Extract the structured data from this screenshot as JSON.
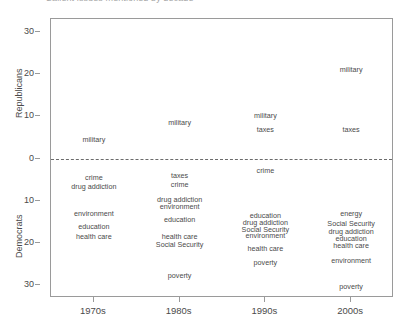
{
  "chart_data": {
    "type": "scatter",
    "title": "Salient issues mentioned by decade",
    "xlabel": "",
    "ylabel_upper": "Republicans",
    "ylabel_lower": "Democrats",
    "x_categories": [
      "1970s",
      "1980s",
      "1990s",
      "2000s"
    ],
    "y_ticks_upper": [
      30,
      20,
      10,
      0
    ],
    "y_ticks_lower": [
      10,
      20,
      30
    ],
    "y_tick_labels": [
      "30",
      "20",
      "10",
      "0",
      "10",
      "20",
      "30"
    ],
    "ylim": [
      -33,
      33
    ],
    "grid": false,
    "legend": null,
    "zero_line": "dashed",
    "note": "Upper half = Republicans (positive), lower half = Democrats (plotted downward). Labels are text markers positioned at their value.",
    "series": [
      {
        "name": "Republicans",
        "points": [
          {
            "decade": "1970s",
            "label": "military",
            "value": 4.3
          },
          {
            "decade": "1980s",
            "label": "military",
            "value": 8.5
          },
          {
            "decade": "1990s",
            "label": "military",
            "value": 10.2
          },
          {
            "decade": "1990s",
            "label": "taxes",
            "value": 6.8
          },
          {
            "decade": "2000s",
            "label": "military",
            "value": 21.0
          },
          {
            "decade": "2000s",
            "label": "taxes",
            "value": 6.8
          }
        ]
      },
      {
        "name": "Democrats",
        "points": [
          {
            "decade": "1970s",
            "label": "crime",
            "value": 4.6
          },
          {
            "decade": "1970s",
            "label": "drug addiction",
            "value": 6.7
          },
          {
            "decade": "1970s",
            "label": "environment",
            "value": 13.1
          },
          {
            "decade": "1970s",
            "label": "education",
            "value": 16.4
          },
          {
            "decade": "1970s",
            "label": "health care",
            "value": 18.6
          },
          {
            "decade": "1980s",
            "label": "taxes",
            "value": 4.2
          },
          {
            "decade": "1980s",
            "label": "crime",
            "value": 6.3
          },
          {
            "decade": "1980s",
            "label": "drug addiction",
            "value": 9.8
          },
          {
            "decade": "1980s",
            "label": "environment",
            "value": 11.5
          },
          {
            "decade": "1980s",
            "label": "education",
            "value": 14.6
          },
          {
            "decade": "1980s",
            "label": "health care",
            "value": 18.6
          },
          {
            "decade": "1980s",
            "label": "Social Security",
            "value": 20.5
          },
          {
            "decade": "1980s",
            "label": "poverty",
            "value": 28.0
          },
          {
            "decade": "1990s",
            "label": "crime",
            "value": 3.0
          },
          {
            "decade": "1990s",
            "label": "education",
            "value": 13.6
          },
          {
            "decade": "1990s",
            "label": "drug addiction",
            "value": 15.3
          },
          {
            "decade": "1990s",
            "label": "Social Security",
            "value": 16.9
          },
          {
            "decade": "1990s",
            "label": "environment",
            "value": 18.4
          },
          {
            "decade": "1990s",
            "label": "health care",
            "value": 21.5
          },
          {
            "decade": "1990s",
            "label": "poverty",
            "value": 24.8
          },
          {
            "decade": "2000s",
            "label": "energy",
            "value": 13.3
          },
          {
            "decade": "2000s",
            "label": "Social Security",
            "value": 15.7
          },
          {
            "decade": "2000s",
            "label": "drug addiction",
            "value": 17.4
          },
          {
            "decade": "2000s",
            "label": "education",
            "value": 19.1
          },
          {
            "decade": "2000s",
            "label": "health care",
            "value": 20.8
          },
          {
            "decade": "2000s",
            "label": "environment",
            "value": 24.3
          },
          {
            "decade": "2000s",
            "label": "poverty",
            "value": 30.5
          }
        ]
      }
    ]
  },
  "axes": {
    "y_title_upper": "Republicans",
    "y_title_lower": "Democrats",
    "x_labels": [
      "1970s",
      "1980s",
      "1990s",
      "2000s"
    ],
    "y_labels": [
      "30",
      "20",
      "10",
      "0",
      "10",
      "20",
      "30"
    ]
  },
  "title": "Salient issues mentioned by decade"
}
